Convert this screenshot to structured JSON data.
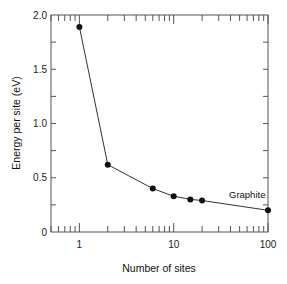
{
  "chart_data": {
    "type": "line",
    "title": "",
    "xlabel": "Number of sites",
    "ylabel": "Energy per site (eV)",
    "xscale": "log",
    "xlim": [
      0.5,
      100
    ],
    "ylim": [
      0,
      2.0
    ],
    "x_ticks": [
      1,
      10,
      100
    ],
    "x_tick_labels": [
      "1",
      "10",
      "100"
    ],
    "y_ticks": [
      0,
      0.5,
      1.0,
      1.5,
      2.0
    ],
    "y_tick_labels": [
      "0",
      "0.5",
      "1.0",
      "1.5",
      "2.0"
    ],
    "grid": false,
    "legend": null,
    "series": [
      {
        "name": "Energy per site",
        "marker": "filled-circle",
        "color": "#111111",
        "x": [
          1,
          2,
          6,
          10,
          15,
          20,
          100
        ],
        "y": [
          1.89,
          0.62,
          0.4,
          0.33,
          0.3,
          0.29,
          0.2
        ]
      }
    ],
    "annotations": [
      {
        "text": "Graphite",
        "x": 100,
        "y": 0.2,
        "position": "above-left"
      }
    ]
  }
}
